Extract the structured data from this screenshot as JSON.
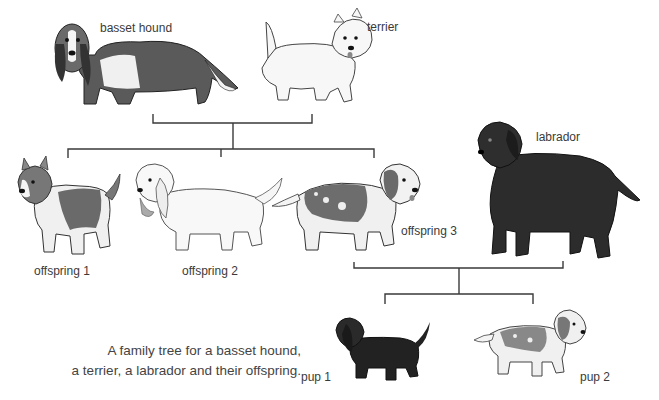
{
  "diagram": {
    "type": "family-tree",
    "caption": {
      "line1": "A family tree for a basset hound,",
      "line2": "a terrier, a labrador and their offspring."
    },
    "nodes": {
      "basset_hound": {
        "label": "basset hound",
        "coat": "tricolor (black, brown, white)",
        "generation": 1
      },
      "terrier": {
        "label": "terrier",
        "coat": "white, wiry",
        "generation": 1
      },
      "offspring_1": {
        "label": "offspring 1",
        "coat": "brown and white patches, pointed ears",
        "generation": 2
      },
      "offspring_2": {
        "label": "offspring 2",
        "coat": "white, shaggy, long ears",
        "generation": 2
      },
      "offspring_3": {
        "label": "offspring 3",
        "coat": "brown patches with white spots",
        "generation": 2
      },
      "labrador": {
        "label": "labrador",
        "coat": "black",
        "generation": 2
      },
      "pup_1": {
        "label": "pup 1",
        "coat": "black",
        "generation": 3
      },
      "pup_2": {
        "label": "pup 2",
        "coat": "white with dark patches",
        "generation": 3
      }
    },
    "edges": [
      {
        "parents": [
          "basset_hound",
          "terrier"
        ],
        "children": [
          "offspring_1",
          "offspring_2",
          "offspring_3"
        ]
      },
      {
        "parents": [
          "offspring_3",
          "labrador"
        ],
        "children": [
          "pup_1",
          "pup_2"
        ]
      }
    ],
    "colors": {
      "line": "#3a3a3a",
      "dark_coat": "#2a2a2a",
      "mid_coat": "#777777",
      "light_coat": "#f4f4f4"
    }
  }
}
